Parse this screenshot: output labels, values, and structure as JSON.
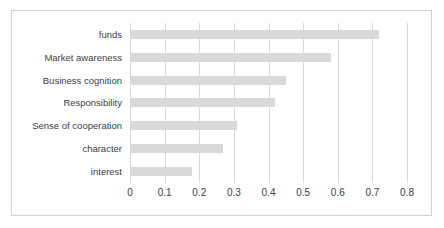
{
  "chart_data": {
    "type": "bar",
    "orientation": "horizontal",
    "title": "",
    "subtitle": "",
    "xlabel": "",
    "ylabel": "",
    "xlim": [
      0,
      0.8
    ],
    "ylim": null,
    "grid": "vertical",
    "legend": "none",
    "bar_color": "#d9d9d9",
    "gridline_color": "#d9d9d9",
    "border_color": "#d0d0d0",
    "text_color": "#404040",
    "xticks": [
      "0",
      "0.1",
      "0.2",
      "0.3",
      "0.4",
      "0.5",
      "0.6",
      "0.7",
      "0.8"
    ],
    "xtick_values": [
      0,
      0.1,
      0.2,
      0.3,
      0.4,
      0.5,
      0.6,
      0.7,
      0.8
    ],
    "categories": [
      "funds",
      "Market awareness",
      "Business cognition",
      "Responsibility",
      "Sense of cooperation",
      "character",
      "interest"
    ],
    "values": [
      0.72,
      0.58,
      0.45,
      0.42,
      0.31,
      0.27,
      0.18
    ]
  }
}
